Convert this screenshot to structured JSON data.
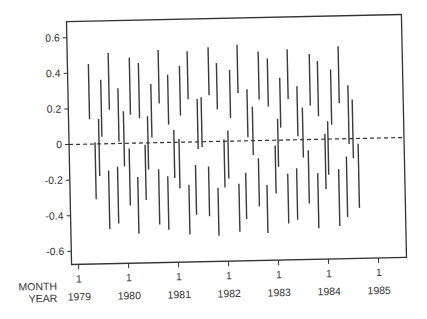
{
  "chart_data": {
    "type": "interval",
    "title": "",
    "xlabel_rows": [
      "MONTH",
      "YEAR"
    ],
    "ylabel": "",
    "ylim": [
      -0.66,
      0.7
    ],
    "xlim": [
      1978.9,
      1985.6
    ],
    "grid": false,
    "legend": null,
    "reference_line": {
      "y": 0,
      "style": "dashed"
    },
    "y_ticks": [
      0.6,
      0.4,
      0.2,
      0,
      -0.2,
      -0.4,
      -0.6
    ],
    "y_tick_labels": [
      "0.6",
      "0.4",
      "0.2",
      "0",
      "-0.2",
      "-0.4",
      "-0.6"
    ],
    "x_ticks": [
      {
        "month": "1",
        "year": "1979"
      },
      {
        "month": "1",
        "year": "1980"
      },
      {
        "month": "1",
        "year": "1981"
      },
      {
        "month": "1",
        "year": "1982"
      },
      {
        "month": "1",
        "year": "1983"
      },
      {
        "month": "1",
        "year": "1984"
      },
      {
        "month": "1",
        "year": "1985"
      }
    ],
    "intervals": [
      {
        "t": 1979.28,
        "lo": 0.14,
        "hi": 0.45
      },
      {
        "t": 1979.38,
        "lo": -0.31,
        "hi": 0.01
      },
      {
        "t": 1979.46,
        "lo": -0.18,
        "hi": 0.14
      },
      {
        "t": 1979.52,
        "lo": 0.04,
        "hi": 0.36
      },
      {
        "t": 1979.64,
        "lo": -0.48,
        "hi": -0.15
      },
      {
        "t": 1979.68,
        "lo": 0.19,
        "hi": 0.51
      },
      {
        "t": 1979.82,
        "lo": -0.45,
        "hi": -0.13
      },
      {
        "t": 1979.86,
        "lo": 0.01,
        "hi": 0.31
      },
      {
        "t": 1979.96,
        "lo": -0.13,
        "hi": 0.18
      },
      {
        "t": 1980.06,
        "lo": -0.35,
        "hi": -0.03
      },
      {
        "t": 1980.1,
        "lo": 0.16,
        "hi": 0.48
      },
      {
        "t": 1980.22,
        "lo": -0.51,
        "hi": -0.19
      },
      {
        "t": 1980.28,
        "lo": 0.14,
        "hi": 0.45
      },
      {
        "t": 1980.38,
        "lo": -0.32,
        "hi": -0.01
      },
      {
        "t": 1980.44,
        "lo": -0.15,
        "hi": 0.15
      },
      {
        "t": 1980.52,
        "lo": 0.03,
        "hi": 0.33
      },
      {
        "t": 1980.64,
        "lo": -0.46,
        "hi": -0.15
      },
      {
        "t": 1980.68,
        "lo": 0.22,
        "hi": 0.52
      },
      {
        "t": 1980.82,
        "lo": -0.49,
        "hi": -0.19
      },
      {
        "t": 1980.86,
        "lo": 0.1,
        "hi": 0.38
      },
      {
        "t": 1980.96,
        "lo": -0.2,
        "hi": 0.07
      },
      {
        "t": 1981.06,
        "lo": -0.26,
        "hi": 0.02
      },
      {
        "t": 1981.1,
        "lo": 0.15,
        "hi": 0.43
      },
      {
        "t": 1981.24,
        "lo": -0.52,
        "hi": -0.24
      },
      {
        "t": 1981.26,
        "lo": 0.24,
        "hi": 0.51
      },
      {
        "t": 1981.38,
        "lo": -0.41,
        "hi": -0.13
      },
      {
        "t": 1981.44,
        "lo": -0.04,
        "hi": 0.24
      },
      {
        "t": 1981.52,
        "lo": -0.03,
        "hi": 0.25
      },
      {
        "t": 1981.64,
        "lo": -0.42,
        "hi": -0.14
      },
      {
        "t": 1981.68,
        "lo": 0.26,
        "hi": 0.53
      },
      {
        "t": 1981.82,
        "lo": -0.53,
        "hi": -0.26
      },
      {
        "t": 1981.84,
        "lo": 0.18,
        "hi": 0.44
      },
      {
        "t": 1981.96,
        "lo": -0.26,
        "hi": 0.01
      },
      {
        "t": 1982.04,
        "lo": -0.21,
        "hi": 0.06
      },
      {
        "t": 1982.1,
        "lo": 0.13,
        "hi": 0.4
      },
      {
        "t": 1982.24,
        "lo": -0.51,
        "hi": -0.24
      },
      {
        "t": 1982.26,
        "lo": 0.27,
        "hi": 0.54
      },
      {
        "t": 1982.38,
        "lo": -0.44,
        "hi": -0.18
      },
      {
        "t": 1982.44,
        "lo": 0.02,
        "hi": 0.29
      },
      {
        "t": 1982.54,
        "lo": -0.08,
        "hi": 0.19
      },
      {
        "t": 1982.64,
        "lo": -0.37,
        "hi": -0.1
      },
      {
        "t": 1982.68,
        "lo": 0.23,
        "hi": 0.5
      },
      {
        "t": 1982.8,
        "lo": -0.52,
        "hi": -0.25
      },
      {
        "t": 1982.86,
        "lo": 0.19,
        "hi": 0.46
      },
      {
        "t": 1982.98,
        "lo": -0.3,
        "hi": -0.03
      },
      {
        "t": 1983.04,
        "lo": -0.15,
        "hi": 0.12
      },
      {
        "t": 1983.1,
        "lo": 0.07,
        "hi": 0.35
      },
      {
        "t": 1983.22,
        "lo": -0.47,
        "hi": -0.19
      },
      {
        "t": 1983.26,
        "lo": 0.23,
        "hi": 0.51
      },
      {
        "t": 1983.4,
        "lo": -0.45,
        "hi": -0.16
      },
      {
        "t": 1983.44,
        "lo": 0.02,
        "hi": 0.3
      },
      {
        "t": 1983.54,
        "lo": -0.1,
        "hi": 0.18
      },
      {
        "t": 1983.64,
        "lo": -0.36,
        "hi": -0.06
      },
      {
        "t": 1983.7,
        "lo": 0.19,
        "hi": 0.48
      },
      {
        "t": 1983.82,
        "lo": -0.5,
        "hi": -0.19
      },
      {
        "t": 1983.86,
        "lo": 0.13,
        "hi": 0.44
      },
      {
        "t": 1983.98,
        "lo": -0.28,
        "hi": 0.03
      },
      {
        "t": 1984.04,
        "lo": -0.2,
        "hi": 0.1
      },
      {
        "t": 1984.12,
        "lo": 0.08,
        "hi": 0.39
      },
      {
        "t": 1984.24,
        "lo": -0.49,
        "hi": -0.17
      },
      {
        "t": 1984.28,
        "lo": 0.2,
        "hi": 0.52
      },
      {
        "t": 1984.4,
        "lo": -0.44,
        "hi": -0.1
      },
      {
        "t": 1984.46,
        "lo": -0.03,
        "hi": 0.3
      },
      {
        "t": 1984.54,
        "lo": -0.11,
        "hi": 0.22
      },
      {
        "t": 1984.64,
        "lo": -0.39,
        "hi": -0.03
      }
    ]
  },
  "layout": {
    "frame_color": "#333333",
    "bar_color": "#3a3a3a",
    "background": "#ffffff"
  }
}
